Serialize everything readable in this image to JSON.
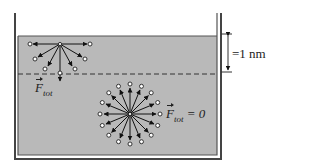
{
  "diagram": {
    "container": {
      "wall_color": "#444444",
      "liquid_color": "#b9b9b9"
    },
    "surface_layer_label": "=1 nm",
    "surface_molecule": {
      "force_label_symbol": "F",
      "force_label_subscript": "tot",
      "arrows": 7,
      "net_force": "downward"
    },
    "bulk_molecule": {
      "force_label_symbol": "F",
      "force_label_subscript": "tot",
      "force_label_suffix": " = 0",
      "arrows": 16,
      "net_force": "zero"
    }
  }
}
